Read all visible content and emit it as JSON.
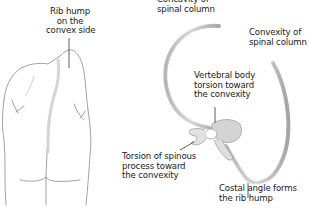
{
  "figure": {
    "left_panel": {
      "subject": "back view of torso with scoliosis",
      "labels": {
        "rib_hump": "Rib hump\non the\nconvex side"
      }
    },
    "right_panel": {
      "subject": "axial view of rib cage and rotated vertebra",
      "labels": {
        "concavity": "Concavity of\nspinal column",
        "convexity": "Convexity of\nspinal column",
        "vertebral_body": "Vertebral body\ntorsion toward\nthe convexity",
        "spinous_process": "Torsion of spinous\nprocess toward\nthe convexity",
        "costal_angle": "Costal angle forms\nthe rib hump"
      }
    },
    "colors": {
      "outline": "#8a8a8a",
      "bone_fill": "#dcdcdc",
      "bone_edge": "#9a9a9a",
      "shadow": "#c8c8c8",
      "text": "#1a1a1a",
      "leader": "#333333"
    }
  }
}
